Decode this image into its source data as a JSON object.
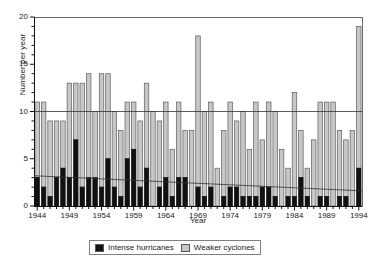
{
  "chart_data": {
    "type": "bar",
    "stacked": true,
    "title": "",
    "xlabel": "Year",
    "ylabel": "Number per year",
    "ylim": [
      0,
      20
    ],
    "yticks": [
      0,
      5,
      10,
      15,
      20
    ],
    "xticks": [
      1944,
      1949,
      1954,
      1959,
      1964,
      1969,
      1974,
      1979,
      1984,
      1989,
      1994
    ],
    "grid": false,
    "reference_lines": [
      {
        "name": "ten-line",
        "type": "horizontal",
        "y": 10
      },
      {
        "name": "intense-trend",
        "type": "trend",
        "y_start": 3.2,
        "y_end": 1.6
      }
    ],
    "legend_position": "bottom-center",
    "categories": [
      1944,
      1945,
      1946,
      1947,
      1948,
      1949,
      1950,
      1951,
      1952,
      1953,
      1954,
      1955,
      1956,
      1957,
      1958,
      1959,
      1960,
      1961,
      1962,
      1963,
      1964,
      1965,
      1966,
      1967,
      1968,
      1969,
      1970,
      1971,
      1972,
      1973,
      1974,
      1975,
      1976,
      1977,
      1978,
      1979,
      1980,
      1981,
      1982,
      1983,
      1984,
      1985,
      1986,
      1987,
      1988,
      1989,
      1990,
      1991,
      1992,
      1993,
      1994
    ],
    "series": [
      {
        "name": "Intense hurricanes",
        "color": "#111111",
        "values": [
          3,
          2,
          1,
          3,
          4,
          3,
          7,
          2,
          3,
          3,
          2,
          5,
          2,
          1,
          5,
          6,
          2,
          4,
          0,
          2,
          3,
          1,
          3,
          3,
          0,
          2,
          1,
          2,
          0,
          1,
          2,
          2,
          1,
          1,
          1,
          2,
          2,
          1,
          0,
          1,
          1,
          3,
          1,
          0,
          1,
          1,
          0,
          1,
          1,
          0,
          4
        ]
      },
      {
        "name": "Weaker cyclones",
        "color": "#c7c7c7",
        "values": [
          8,
          9,
          8,
          6,
          5,
          10,
          6,
          11,
          11,
          7,
          12,
          9,
          8,
          7,
          6,
          5,
          7,
          9,
          10,
          7,
          8,
          5,
          8,
          5,
          8,
          16,
          9,
          9,
          4,
          7,
          9,
          7,
          9,
          5,
          10,
          5,
          9,
          9,
          6,
          3,
          11,
          5,
          3,
          7,
          10,
          10,
          11,
          7,
          6,
          8,
          15
        ]
      }
    ]
  },
  "legend": {
    "items": [
      {
        "label": "Intense hurricanes",
        "color": "#111111"
      },
      {
        "label": "Weaker cyclones",
        "color": "#c7c7c7"
      }
    ]
  }
}
